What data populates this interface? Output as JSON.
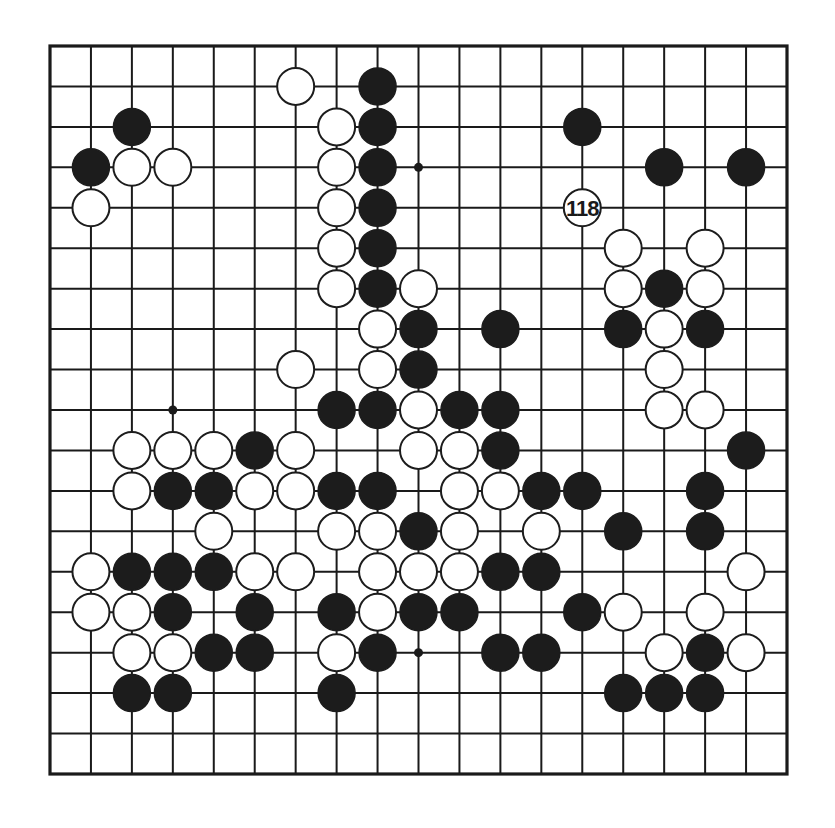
{
  "board": {
    "size": 19,
    "colors": {
      "black": "#1c1c1c",
      "white": "#ffffff",
      "line": "#1a1a1a",
      "background": "#ffffff"
    },
    "star_points": [
      [
        9,
        3
      ],
      [
        3,
        9
      ],
      [
        9,
        15
      ]
    ],
    "labeled_move": {
      "col": 13,
      "row": 4,
      "color": "white",
      "label": "118"
    },
    "stones": {
      "black": [
        [
          8,
          1
        ],
        [
          2,
          2
        ],
        [
          8,
          2
        ],
        [
          13,
          2
        ],
        [
          1,
          3
        ],
        [
          8,
          3
        ],
        [
          15,
          3
        ],
        [
          17,
          3
        ],
        [
          8,
          4
        ],
        [
          8,
          5
        ],
        [
          8,
          6
        ],
        [
          15,
          6
        ],
        [
          9,
          7
        ],
        [
          11,
          7
        ],
        [
          14,
          7
        ],
        [
          16,
          7
        ],
        [
          9,
          8
        ],
        [
          7,
          9
        ],
        [
          8,
          9
        ],
        [
          10,
          9
        ],
        [
          11,
          9
        ],
        [
          5,
          10
        ],
        [
          11,
          10
        ],
        [
          17,
          10
        ],
        [
          3,
          11
        ],
        [
          4,
          11
        ],
        [
          7,
          11
        ],
        [
          8,
          11
        ],
        [
          12,
          11
        ],
        [
          13,
          11
        ],
        [
          16,
          11
        ],
        [
          9,
          12
        ],
        [
          14,
          12
        ],
        [
          16,
          12
        ],
        [
          2,
          13
        ],
        [
          3,
          13
        ],
        [
          4,
          13
        ],
        [
          11,
          13
        ],
        [
          12,
          13
        ],
        [
          3,
          14
        ],
        [
          5,
          14
        ],
        [
          7,
          14
        ],
        [
          9,
          14
        ],
        [
          10,
          14
        ],
        [
          13,
          14
        ],
        [
          4,
          15
        ],
        [
          5,
          15
        ],
        [
          8,
          15
        ],
        [
          11,
          15
        ],
        [
          12,
          15
        ],
        [
          16,
          15
        ],
        [
          2,
          16
        ],
        [
          3,
          16
        ],
        [
          7,
          16
        ],
        [
          14,
          16
        ],
        [
          15,
          16
        ],
        [
          16,
          16
        ]
      ],
      "white": [
        [
          6,
          1
        ],
        [
          7,
          2
        ],
        [
          2,
          3
        ],
        [
          3,
          3
        ],
        [
          7,
          3
        ],
        [
          1,
          4
        ],
        [
          7,
          4
        ],
        [
          7,
          5
        ],
        [
          14,
          5
        ],
        [
          16,
          5
        ],
        [
          7,
          6
        ],
        [
          9,
          6
        ],
        [
          14,
          6
        ],
        [
          16,
          6
        ],
        [
          8,
          7
        ],
        [
          15,
          7
        ],
        [
          6,
          8
        ],
        [
          8,
          8
        ],
        [
          15,
          8
        ],
        [
          9,
          9
        ],
        [
          15,
          9
        ],
        [
          16,
          9
        ],
        [
          2,
          10
        ],
        [
          3,
          10
        ],
        [
          4,
          10
        ],
        [
          6,
          10
        ],
        [
          9,
          10
        ],
        [
          10,
          10
        ],
        [
          2,
          11
        ],
        [
          5,
          11
        ],
        [
          6,
          11
        ],
        [
          10,
          11
        ],
        [
          11,
          11
        ],
        [
          4,
          12
        ],
        [
          7,
          12
        ],
        [
          8,
          12
        ],
        [
          10,
          12
        ],
        [
          12,
          12
        ],
        [
          1,
          13
        ],
        [
          5,
          13
        ],
        [
          6,
          13
        ],
        [
          8,
          13
        ],
        [
          9,
          13
        ],
        [
          10,
          13
        ],
        [
          17,
          13
        ],
        [
          1,
          14
        ],
        [
          2,
          14
        ],
        [
          8,
          14
        ],
        [
          14,
          14
        ],
        [
          16,
          14
        ],
        [
          2,
          15
        ],
        [
          3,
          15
        ],
        [
          7,
          15
        ],
        [
          15,
          15
        ],
        [
          17,
          15
        ]
      ]
    }
  }
}
